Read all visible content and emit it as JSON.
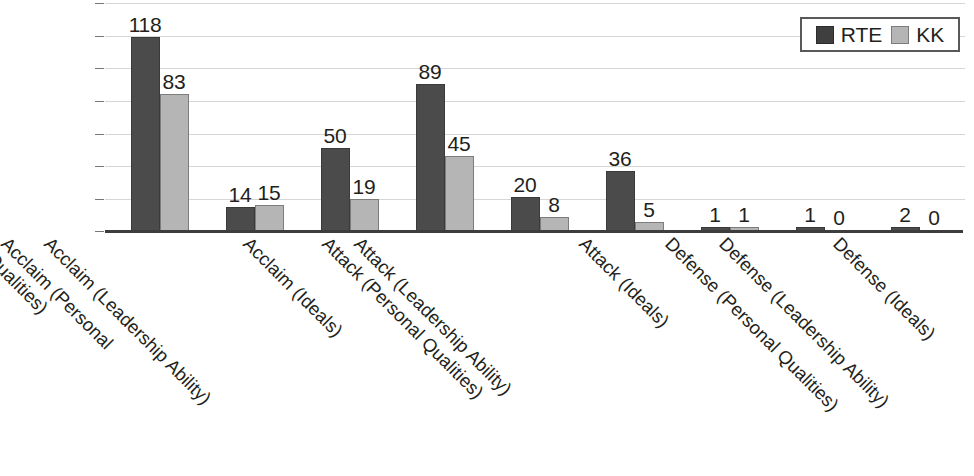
{
  "chart_data": {
    "type": "bar",
    "title": "",
    "subtitle": "",
    "xlabel": "",
    "ylabel": "",
    "ylim": [
      0,
      140
    ],
    "grid": true,
    "gridline_step": 20,
    "legend_position": "top-right",
    "categories": [
      "Acclaim (Personal\nQualities)",
      "Acclaim (Leadership Ability)",
      "Acclaim (Ideals)",
      "Attack (Personal Qualities)",
      "Attack (Leadership Ability)",
      "Attack (Ideals)",
      "Defense (Personal Qualities)",
      "Defense (Leadership Ability)",
      "Defense (Ideals)"
    ],
    "series": [
      {
        "name": "RTE",
        "color": "#4b4b4b",
        "values": [
          118,
          14,
          50,
          89,
          20,
          36,
          1,
          1,
          2
        ],
        "labels": [
          "118",
          "14",
          "50",
          "89",
          "20",
          "36",
          "1",
          "1",
          "2"
        ]
      },
      {
        "name": "KK",
        "color": "#b5b5b5",
        "values": [
          83,
          15,
          19,
          45,
          8,
          5,
          1,
          0,
          0
        ],
        "labels": [
          "83",
          "15",
          "19",
          "45",
          "8",
          "5",
          "1",
          "0",
          "0"
        ]
      }
    ]
  },
  "legend": {
    "entries": [
      {
        "label": "RTE",
        "swatch": "rte"
      },
      {
        "label": "KK",
        "swatch": "kk"
      }
    ]
  },
  "axis": {
    "baseline_color": "#3d3d3d",
    "gridline_color": "#d6d6d6"
  }
}
